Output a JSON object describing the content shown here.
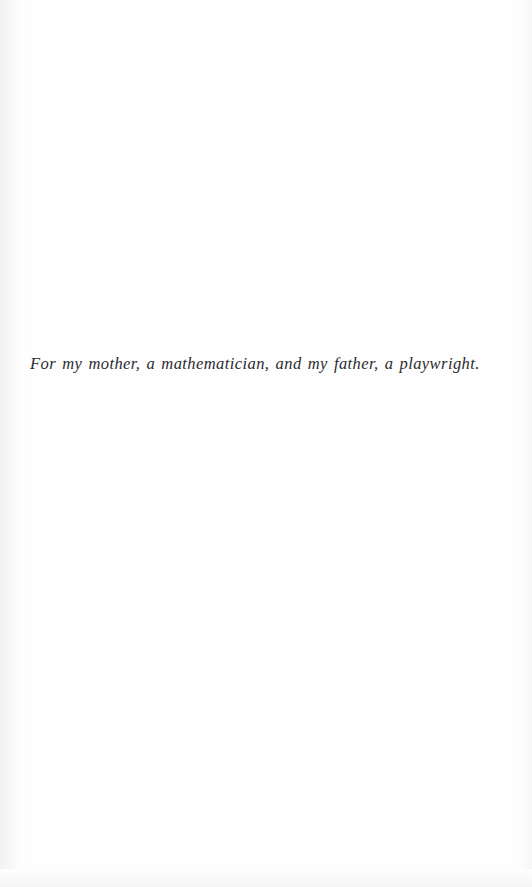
{
  "page": {
    "kind": "book-dedication-page",
    "background_color": "#fefefe",
    "text_color": "#2b2b2e"
  },
  "dedication": {
    "text": "For my mother, a mathematician, and my father, a playwright."
  }
}
